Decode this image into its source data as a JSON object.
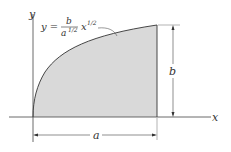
{
  "diagram": {
    "axes": {
      "x_label": "x",
      "y_label": "y"
    },
    "equation": {
      "lhs": "y =",
      "numerator": "b",
      "denominator": "a",
      "denominator_exp": "1/2",
      "factor": "x",
      "factor_exp": "1/2"
    },
    "dimensions": {
      "width_label": "a",
      "height_label": "b"
    },
    "colors": {
      "fill": "#d9d9d9",
      "line": "#333333",
      "curve": "#333333"
    }
  }
}
